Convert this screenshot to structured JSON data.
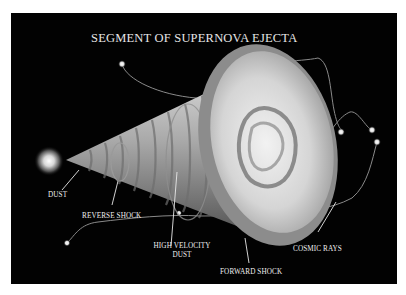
{
  "title": "SEGMENT OF SUPERNOVA EJECTA",
  "labels": {
    "dust": "DUST",
    "reverse_shock": "REVERSE SHOCK",
    "high_velocity_dust_line1": "HIGH VELOCITY",
    "high_velocity_dust_line2": "DUST",
    "forward_shock": "FORWARD SHOCK",
    "cosmic_rays": "COSMIC RAYS"
  },
  "colors": {
    "background": "#020202",
    "border": "#ffffff",
    "text": "#f0f0f0"
  }
}
